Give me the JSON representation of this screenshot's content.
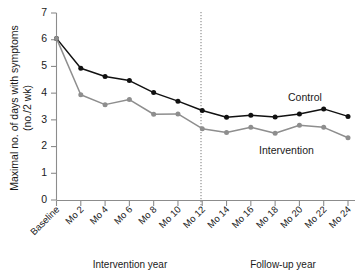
{
  "chart_data": {
    "type": "line",
    "title": "",
    "xlabel": "",
    "ylabel": "Maximal no. of days with symptoms",
    "ylabel_line2": "(no./2 wk)",
    "ylim": [
      0,
      7
    ],
    "yticks": [
      0,
      1,
      2,
      3,
      4,
      5,
      6,
      7
    ],
    "ytick_labels": [
      "0",
      "1",
      "2",
      "3",
      "4",
      "5",
      "6",
      "7"
    ],
    "grid": false,
    "legend_position": "inline-right",
    "categories": [
      "Baseline",
      "Mo 2",
      "Mo 4",
      "Mo 6",
      "Mo 8",
      "Mo 10",
      "Mo 12",
      "Mo 14",
      "Mo 16",
      "Mo 18",
      "Mo 20",
      "Mo 22",
      "Mo 24"
    ],
    "series": [
      {
        "name": "Control",
        "color": "#111111",
        "values": [
          6.05,
          4.93,
          4.62,
          4.47,
          4.02,
          3.7,
          3.35,
          3.1,
          3.17,
          3.11,
          3.22,
          3.41,
          3.13
        ]
      },
      {
        "name": "Intervention",
        "color": "#8e8e8e",
        "values": [
          6.05,
          3.94,
          3.57,
          3.76,
          3.21,
          3.22,
          2.67,
          2.53,
          2.72,
          2.5,
          2.8,
          2.72,
          2.33
        ]
      }
    ],
    "annotations": [
      {
        "name": "divider",
        "text": "",
        "at_category": "Mo 12",
        "style": "vertical-dotted"
      },
      {
        "name": "period-1",
        "text": "Intervention year",
        "span": [
          "Baseline",
          "Mo 12"
        ]
      },
      {
        "name": "period-2",
        "text": "Follow-up year",
        "span": [
          "Mo 12",
          "Mo 24"
        ]
      }
    ]
  },
  "labels": {
    "y_axis_line1": "Maximal no. of days with symptoms",
    "y_axis_line2": "(no./2 wk)",
    "series_control": "Control",
    "series_intervention": "Intervention",
    "period_intervention": "Intervention year",
    "period_followup": "Follow-up year"
  },
  "colors": {
    "control": "#111111",
    "intervention": "#8e8e8e",
    "axis": "#8c8c8c",
    "background": "#ffffff"
  }
}
